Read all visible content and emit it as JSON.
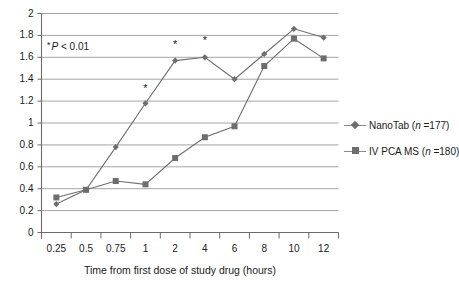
{
  "chart_data": {
    "type": "line",
    "title": "",
    "subtitle": "",
    "xlabel": "Time from first dose of study drug (hours)",
    "ylabel": "",
    "categories": [
      "0.25",
      "0.5",
      "0.75",
      "1",
      "2",
      "4",
      "6",
      "8",
      "10",
      "12"
    ],
    "ylim": [
      0,
      2
    ],
    "ytick_values": [
      "0",
      "0.2",
      "0.4",
      "0.6",
      "0.8",
      "1",
      "1.2",
      "1.4",
      "1.6",
      "1.8",
      "2"
    ],
    "grid": "horizontal",
    "legend_position": "right",
    "series": [
      {
        "name": "NanoTab (n =177)",
        "name_prefix": "NanoTab (",
        "name_italic": "n",
        "name_suffix": " =177)",
        "marker": "diamond",
        "color": "#6e6e6e",
        "values": [
          0.26,
          0.39,
          0.78,
          1.18,
          1.57,
          1.6,
          1.4,
          1.63,
          1.86,
          1.78
        ]
      },
      {
        "name": "IV PCA MS (n =180)",
        "name_prefix": "IV PCA MS (",
        "name_italic": "n",
        "name_suffix": " =180)",
        "marker": "square",
        "color": "#6e6e6e",
        "values": [
          0.32,
          0.39,
          0.47,
          0.44,
          0.68,
          0.87,
          0.97,
          1.52,
          1.77,
          1.59
        ]
      }
    ],
    "annotations": [
      {
        "text": "* P < 0.01",
        "symbol": "*",
        "label": "P < 0.01",
        "x": "0.5",
        "y": 1.72
      },
      {
        "symbol": "*",
        "x": "1",
        "y": 1.32
      },
      {
        "symbol": "*",
        "x": "2",
        "y": 1.72
      },
      {
        "symbol": "*",
        "x": "4",
        "y": 1.76
      }
    ],
    "significance_markers": [
      {
        "category": "1",
        "y": 1.32
      },
      {
        "category": "2",
        "y": 1.72
      },
      {
        "category": "4",
        "y": 1.76
      }
    ]
  },
  "note": {
    "asterisk": "*",
    "p_letter": "P",
    "p_text": " < 0.01"
  },
  "axes": {
    "x_title": "Time from first dose of study drug (hours)"
  },
  "legend": {
    "items": [
      {
        "prefix": "NanoTab (",
        "italic": "n",
        "suffix": " =177)",
        "marker": "diamond"
      },
      {
        "prefix": "IV PCA MS (",
        "italic": "n",
        "suffix": " =180)",
        "marker": "square"
      }
    ]
  }
}
